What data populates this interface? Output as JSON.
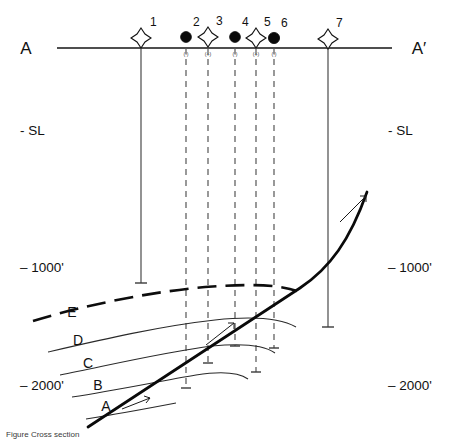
{
  "figure": {
    "type": "geologic-cross-section",
    "caption": "Figure   Cross section",
    "section_start_label": "A",
    "section_end_label": "A′",
    "background_color": "#ffffff",
    "line_color": "#111111"
  },
  "datum": {
    "label_left": "A",
    "label_right": "A′",
    "y": 48
  },
  "depth_scale": {
    "left": [
      {
        "label": "- SL",
        "y": 130
      },
      {
        "label": "– 1000'",
        "y": 267
      },
      {
        "label": "– 2000'",
        "y": 385
      }
    ],
    "right": [
      {
        "label": "- SL",
        "y": 130
      },
      {
        "label": "– 1000'",
        "y": 267
      },
      {
        "label": "– 2000'",
        "y": 385
      }
    ]
  },
  "wells": [
    {
      "number": "1",
      "x": 141,
      "symbol": "open-star",
      "polarity": "",
      "trace": "solid",
      "bottom_y": 283
    },
    {
      "number": "2",
      "x": 186,
      "symbol": "filled-circle",
      "polarity": "(-)",
      "trace": "dashed",
      "bottom_y": 388
    },
    {
      "number": "3",
      "x": 208,
      "symbol": "open-star",
      "polarity": "(+)",
      "trace": "dashed",
      "bottom_y": 363
    },
    {
      "number": "4",
      "x": 235,
      "symbol": "filled-circle",
      "polarity": "(-)",
      "trace": "dashed",
      "bottom_y": 346
    },
    {
      "number": "5",
      "x": 256,
      "symbol": "open-star",
      "polarity": "(+)",
      "trace": "dashed",
      "bottom_y": 372
    },
    {
      "number": "6",
      "x": 274,
      "symbol": "filled-circle",
      "polarity": "(-)",
      "trace": "dashed",
      "bottom_y": 348
    },
    {
      "number": "7",
      "x": 328,
      "symbol": "open-star",
      "polarity": "",
      "trace": "solid",
      "bottom_y": 327
    }
  ],
  "horizons": [
    {
      "label": "E",
      "label_x": 72,
      "label_y": 317,
      "style": "dashed-thick"
    },
    {
      "label": "D",
      "label_x": 78,
      "label_y": 345,
      "style": "thin"
    },
    {
      "label": "C",
      "label_x": 88,
      "label_y": 368,
      "style": "thin"
    },
    {
      "label": "B",
      "label_x": 98,
      "label_y": 390,
      "style": "thin"
    },
    {
      "label": "A",
      "label_x": 106,
      "label_y": 411,
      "style": "fault-thick"
    }
  ],
  "fault": {
    "name": "reverse-fault",
    "arrow_count": 2,
    "sense": "up-dip"
  }
}
